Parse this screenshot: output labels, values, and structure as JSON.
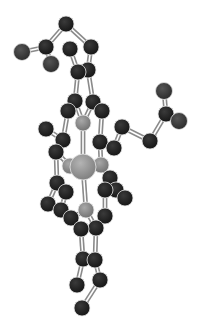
{
  "figure": {
    "type": "ball-and-stick molecular model",
    "background": "#ffffff",
    "colors": {
      "carbon": "#222222",
      "oxygen": "#3a3a3a",
      "nitrogen": "#8c8c8c",
      "metal": "#9a9a9a",
      "bond": "#8a8a8a"
    }
  },
  "atoms": [
    {
      "id": 0,
      "el": "C",
      "x": 66,
      "y": 24,
      "r": 8
    },
    {
      "id": 1,
      "el": "C",
      "x": 46,
      "y": 47,
      "r": 8
    },
    {
      "id": 2,
      "el": "O",
      "x": 22,
      "y": 52,
      "r": 8.5
    },
    {
      "id": 3,
      "el": "O",
      "x": 51,
      "y": 64,
      "r": 8.5
    },
    {
      "id": 4,
      "el": "C",
      "x": 70,
      "y": 49,
      "r": 8
    },
    {
      "id": 5,
      "el": "C",
      "x": 91,
      "y": 47,
      "r": 8
    },
    {
      "id": 6,
      "el": "C",
      "x": 78,
      "y": 72,
      "r": 8
    },
    {
      "id": 7,
      "el": "C",
      "x": 88,
      "y": 70,
      "r": 8
    },
    {
      "id": 8,
      "el": "C",
      "x": 75,
      "y": 101,
      "r": 8
    },
    {
      "id": 9,
      "el": "C",
      "x": 93,
      "y": 102,
      "r": 8
    },
    {
      "id": 10,
      "el": "C",
      "x": 68,
      "y": 111,
      "r": 8
    },
    {
      "id": 11,
      "el": "C",
      "x": 102,
      "y": 111,
      "r": 8
    },
    {
      "id": 12,
      "el": "N",
      "x": 83,
      "y": 123,
      "r": 8
    },
    {
      "id": 13,
      "el": "C",
      "x": 46,
      "y": 129,
      "r": 8
    },
    {
      "id": 14,
      "el": "C",
      "x": 63,
      "y": 140,
      "r": 8
    },
    {
      "id": 15,
      "el": "C",
      "x": 56,
      "y": 152,
      "r": 8
    },
    {
      "id": 16,
      "el": "C",
      "x": 100,
      "y": 142,
      "r": 8
    },
    {
      "id": 17,
      "el": "C",
      "x": 114,
      "y": 148,
      "r": 8
    },
    {
      "id": 18,
      "el": "C",
      "x": 122,
      "y": 127,
      "r": 8
    },
    {
      "id": 19,
      "el": "C",
      "x": 150,
      "y": 141,
      "r": 8
    },
    {
      "id": 20,
      "el": "C",
      "x": 166,
      "y": 114,
      "r": 8
    },
    {
      "id": 21,
      "el": "O",
      "x": 164,
      "y": 91,
      "r": 8.5
    },
    {
      "id": 22,
      "el": "O",
      "x": 179,
      "y": 121,
      "r": 8.5
    },
    {
      "id": 23,
      "el": "N",
      "x": 70,
      "y": 166,
      "r": 8
    },
    {
      "id": 24,
      "el": "M",
      "x": 83,
      "y": 167,
      "r": 13
    },
    {
      "id": 25,
      "el": "N",
      "x": 101,
      "y": 165,
      "r": 8
    },
    {
      "id": 26,
      "el": "C",
      "x": 57,
      "y": 183,
      "r": 8
    },
    {
      "id": 27,
      "el": "C",
      "x": 66,
      "y": 192,
      "r": 8
    },
    {
      "id": 28,
      "el": "C",
      "x": 48,
      "y": 204,
      "r": 8
    },
    {
      "id": 29,
      "el": "C",
      "x": 110,
      "y": 178,
      "r": 8
    },
    {
      "id": 30,
      "el": "C",
      "x": 116,
      "y": 190,
      "r": 8
    },
    {
      "id": 31,
      "el": "C",
      "x": 125,
      "y": 198,
      "r": 8
    },
    {
      "id": 32,
      "el": "C",
      "x": 105,
      "y": 190,
      "r": 8
    },
    {
      "id": 33,
      "el": "C",
      "x": 61,
      "y": 210,
      "r": 8
    },
    {
      "id": 34,
      "el": "C",
      "x": 71,
      "y": 218,
      "r": 8
    },
    {
      "id": 35,
      "el": "N",
      "x": 86,
      "y": 210,
      "r": 8
    },
    {
      "id": 36,
      "el": "C",
      "x": 105,
      "y": 216,
      "r": 8
    },
    {
      "id": 37,
      "el": "C",
      "x": 81,
      "y": 229,
      "r": 8
    },
    {
      "id": 38,
      "el": "C",
      "x": 96,
      "y": 228,
      "r": 8
    },
    {
      "id": 39,
      "el": "C",
      "x": 83,
      "y": 259,
      "r": 8
    },
    {
      "id": 40,
      "el": "C",
      "x": 95,
      "y": 260,
      "r": 8
    },
    {
      "id": 41,
      "el": "C",
      "x": 77,
      "y": 285,
      "r": 8
    },
    {
      "id": 42,
      "el": "C",
      "x": 100,
      "y": 280,
      "r": 8
    },
    {
      "id": 43,
      "el": "C",
      "x": 82,
      "y": 308,
      "r": 8
    }
  ],
  "bonds": [
    [
      0,
      1
    ],
    [
      1,
      2
    ],
    [
      1,
      3
    ],
    [
      0,
      5
    ],
    [
      4,
      6
    ],
    [
      5,
      7
    ],
    [
      6,
      7
    ],
    [
      6,
      8
    ],
    [
      7,
      9
    ],
    [
      8,
      10
    ],
    [
      9,
      11
    ],
    [
      8,
      12
    ],
    [
      9,
      12
    ],
    [
      10,
      14
    ],
    [
      13,
      14
    ],
    [
      14,
      15
    ],
    [
      11,
      16
    ],
    [
      16,
      17
    ],
    [
      17,
      18
    ],
    [
      18,
      19
    ],
    [
      19,
      20
    ],
    [
      20,
      21
    ],
    [
      20,
      22
    ],
    [
      15,
      23
    ],
    [
      16,
      25
    ],
    [
      12,
      24
    ],
    [
      23,
      24
    ],
    [
      24,
      25
    ],
    [
      15,
      26
    ],
    [
      26,
      27
    ],
    [
      26,
      28
    ],
    [
      27,
      33
    ],
    [
      28,
      33
    ],
    [
      25,
      29
    ],
    [
      29,
      30
    ],
    [
      30,
      31
    ],
    [
      29,
      32
    ],
    [
      33,
      34
    ],
    [
      34,
      35
    ],
    [
      35,
      24
    ],
    [
      35,
      38
    ],
    [
      32,
      36
    ],
    [
      36,
      38
    ],
    [
      34,
      37
    ],
    [
      37,
      39
    ],
    [
      38,
      40
    ],
    [
      39,
      40
    ],
    [
      39,
      41
    ],
    [
      40,
      42
    ],
    [
      42,
      43
    ]
  ]
}
